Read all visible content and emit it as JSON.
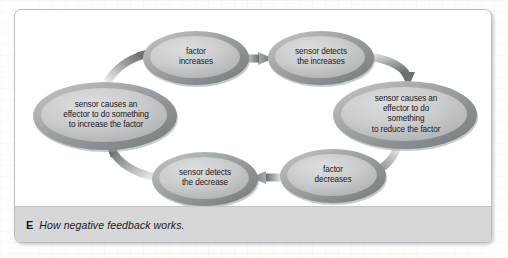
{
  "figure": {
    "caption_letter": "E",
    "caption_text": "How negative feedback works.",
    "background": "#ffffff",
    "caption_bar_color": "#d6d7d9",
    "border_color": "#b9bcbf"
  },
  "diagram": {
    "type": "cycle",
    "title": "How negative feedback works.",
    "node_fill_light": "#d0d2d3",
    "node_fill_dark": "#a7abad",
    "node_ring_color": "#8d9295",
    "arrow_dark": "#6e7477",
    "arrow_light": "#e8eaea",
    "nodes": [
      {
        "id": "factor-increases",
        "label": "factor\nincreases",
        "cx": 181,
        "cy": 48,
        "rx": 53,
        "ry": 27
      },
      {
        "id": "sensor-detects-increase",
        "label": "sensor detects\nthe increases",
        "cx": 306,
        "cy": 48,
        "rx": 53,
        "ry": 27
      },
      {
        "id": "effector-reduce",
        "label": "sensor causes an\neffector to do something\nto reduce the factor",
        "cx": 390,
        "cy": 105,
        "rx": 72,
        "ry": 34
      },
      {
        "id": "factor-decreases",
        "label": "factor\ndecreases",
        "cx": 318,
        "cy": 166,
        "rx": 53,
        "ry": 27
      },
      {
        "id": "sensor-detects-decrease",
        "label": "sensor detects\nthe decrease",
        "cx": 190,
        "cy": 169,
        "rx": 53,
        "ry": 27
      },
      {
        "id": "effector-increase",
        "label": "sensor causes an\neffector to do something\nto increase the factor",
        "cx": 90,
        "cy": 106,
        "rx": 72,
        "ry": 34
      }
    ],
    "edges": [
      {
        "from": "factor-increases",
        "to": "sensor-detects-increase",
        "shape": "straight",
        "direction": "right"
      },
      {
        "from": "sensor-detects-increase",
        "to": "effector-reduce",
        "shape": "curved",
        "direction": "down-right"
      },
      {
        "from": "effector-reduce",
        "to": "factor-decreases",
        "shape": "curved",
        "direction": "down-left"
      },
      {
        "from": "factor-decreases",
        "to": "sensor-detects-decrease",
        "shape": "straight",
        "direction": "left"
      },
      {
        "from": "sensor-detects-decrease",
        "to": "effector-increase",
        "shape": "curved",
        "direction": "up-left"
      },
      {
        "from": "effector-increase",
        "to": "factor-increases",
        "shape": "curved",
        "direction": "up-right"
      }
    ]
  }
}
